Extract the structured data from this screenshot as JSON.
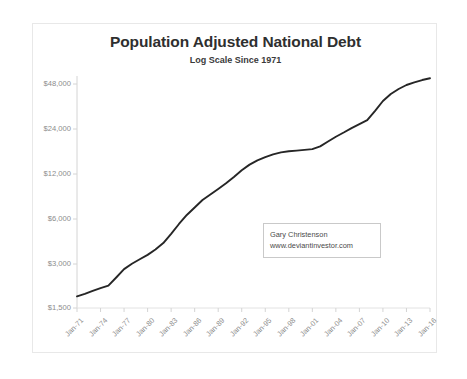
{
  "chart_data": {
    "type": "line",
    "title": "Population Adjusted National Debt",
    "subtitle": "Log Scale Since 1971",
    "xlabel": "",
    "ylabel": "",
    "scale": "log",
    "grid": false,
    "legend": "none",
    "ylim": [
      1500,
      60000
    ],
    "ytick_labels": [
      "$48,000",
      "$24,000",
      "$12,000",
      "$6,000",
      "$3,000",
      "$1,500"
    ],
    "ytick_values": [
      48000,
      24000,
      12000,
      6000,
      3000,
      1500
    ],
    "xtick_labels": [
      "Jan-71",
      "Jan-74",
      "Jan-77",
      "Jan-80",
      "Jan-83",
      "Jan-86",
      "Jan-89",
      "Jan-92",
      "Jan-95",
      "Jan-98",
      "Jan-01",
      "Jan-04",
      "Jan-07",
      "Jan-10",
      "Jan-13",
      "Jan-16"
    ],
    "line_color": "#262626",
    "series": [
      {
        "name": "Population Adjusted National Debt",
        "x": [
          "Jan-71",
          "Jan-72",
          "Jan-73",
          "Jan-74",
          "Jan-75",
          "Jan-76",
          "Jan-77",
          "Jan-78",
          "Jan-79",
          "Jan-80",
          "Jan-81",
          "Jan-82",
          "Jan-83",
          "Jan-84",
          "Jan-85",
          "Jan-86",
          "Jan-87",
          "Jan-88",
          "Jan-89",
          "Jan-90",
          "Jan-91",
          "Jan-92",
          "Jan-93",
          "Jan-94",
          "Jan-95",
          "Jan-96",
          "Jan-97",
          "Jan-98",
          "Jan-99",
          "Jan-00",
          "Jan-01",
          "Jan-02",
          "Jan-03",
          "Jan-04",
          "Jan-05",
          "Jan-06",
          "Jan-07",
          "Jan-08",
          "Jan-09",
          "Jan-10",
          "Jan-11",
          "Jan-12",
          "Jan-13",
          "Jan-14",
          "Jan-15",
          "Jan-16"
        ],
        "values": [
          1800,
          1870,
          1960,
          2050,
          2130,
          2420,
          2760,
          3000,
          3220,
          3450,
          3750,
          4150,
          4800,
          5600,
          6450,
          7250,
          8150,
          8900,
          9700,
          10600,
          11700,
          13000,
          14200,
          15200,
          16000,
          16700,
          17200,
          17500,
          17700,
          17900,
          18100,
          18900,
          20400,
          22000,
          23500,
          25200,
          26800,
          28500,
          33000,
          38500,
          43000,
          46500,
          49500,
          51500,
          53500,
          55000
        ]
      }
    ]
  },
  "annotation": {
    "author": "Gary Christenson",
    "website": "www.deviantinvestor.com"
  }
}
